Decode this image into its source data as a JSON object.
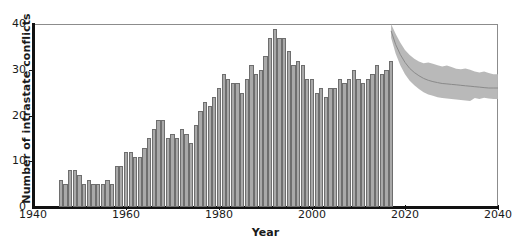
{
  "chart_data": {
    "type": "bar",
    "title": "",
    "xlabel": "Year",
    "ylabel": "Number of intrastate conflicts",
    "xlim": [
      1940,
      2040
    ],
    "ylim": [
      0,
      40
    ],
    "xticks": [
      1940,
      1960,
      1980,
      2000,
      2020,
      2040
    ],
    "yticks": [
      0,
      10,
      20,
      30,
      40
    ],
    "grid": false,
    "legend": null,
    "bar_color": "#a9a9a9",
    "bar_edge_color": "#6e6e6e",
    "band_color": "#b5b5b5",
    "band_line_color": "#8a8a8a",
    "series": [
      {
        "name": "Observed intrastate conflicts",
        "type": "bar",
        "x": [
          1946,
          1947,
          1948,
          1949,
          1950,
          1951,
          1952,
          1953,
          1954,
          1955,
          1956,
          1957,
          1958,
          1959,
          1960,
          1961,
          1962,
          1963,
          1964,
          1965,
          1966,
          1967,
          1968,
          1969,
          1970,
          1971,
          1972,
          1973,
          1974,
          1975,
          1976,
          1977,
          1978,
          1979,
          1980,
          1981,
          1982,
          1983,
          1984,
          1985,
          1986,
          1987,
          1988,
          1989,
          1990,
          1991,
          1992,
          1993,
          1994,
          1995,
          1996,
          1997,
          1998,
          1999,
          2000,
          2001,
          2002,
          2003,
          2004,
          2005,
          2006,
          2007,
          2008,
          2009,
          2010,
          2011,
          2012,
          2013,
          2014,
          2015,
          2016,
          2017
        ],
        "values": [
          6,
          5,
          8,
          8,
          7,
          5,
          6,
          5,
          5,
          5,
          6,
          5,
          9,
          9,
          12,
          12,
          11,
          11,
          13,
          15,
          17,
          19,
          19,
          15,
          16,
          15,
          17,
          16,
          14,
          18,
          21,
          23,
          22,
          24,
          26,
          29,
          28,
          27,
          27,
          25,
          28,
          31,
          29,
          30,
          33,
          37,
          39,
          37,
          37,
          34,
          31,
          32,
          31,
          28,
          28,
          25,
          26,
          24,
          26,
          26,
          28,
          27,
          28,
          30,
          28,
          27,
          28,
          29,
          31,
          29,
          30,
          32
        ]
      },
      {
        "name": "Projection median",
        "type": "line",
        "x": [
          2017,
          2018,
          2019,
          2020,
          2021,
          2022,
          2023,
          2024,
          2025,
          2026,
          2027,
          2028,
          2029,
          2030,
          2031,
          2032,
          2033,
          2034,
          2035,
          2036,
          2037,
          2038,
          2039,
          2040
        ],
        "values": [
          38.5,
          35.5,
          33.3,
          31.6,
          30.3,
          29.4,
          28.7,
          28.1,
          27.7,
          27.4,
          27.2,
          27.0,
          26.9,
          26.8,
          26.7,
          26.6,
          26.5,
          26.4,
          26.3,
          26.2,
          26.1,
          26.0,
          26.0,
          26.0
        ]
      },
      {
        "name": "Projection uncertainty band upper",
        "type": "band-upper",
        "x": [
          2017,
          2018,
          2019,
          2020,
          2021,
          2022,
          2023,
          2024,
          2025,
          2026,
          2027,
          2028,
          2029,
          2030,
          2031,
          2032,
          2033,
          2034,
          2035,
          2036,
          2037,
          2038,
          2039,
          2040
        ],
        "values": [
          40.0,
          37.8,
          35.9,
          34.3,
          33.2,
          32.4,
          31.8,
          31.4,
          31.6,
          31.3,
          31.0,
          30.7,
          30.9,
          30.6,
          30.2,
          30.1,
          30.3,
          30.0,
          29.6,
          29.4,
          29.6,
          29.3,
          29.0,
          29.0
        ]
      },
      {
        "name": "Projection uncertainty band lower",
        "type": "band-lower",
        "x": [
          2017,
          2018,
          2019,
          2020,
          2021,
          2022,
          2023,
          2024,
          2025,
          2026,
          2027,
          2028,
          2029,
          2030,
          2031,
          2032,
          2033,
          2034,
          2035,
          2036,
          2037,
          2038,
          2039,
          2040
        ],
        "values": [
          37.0,
          33.5,
          30.9,
          29.0,
          27.6,
          26.6,
          25.8,
          25.1,
          24.6,
          24.3,
          24.0,
          23.8,
          23.7,
          23.6,
          23.5,
          23.4,
          23.3,
          23.2,
          23.8,
          23.6,
          23.9,
          23.7,
          23.6,
          23.6
        ]
      }
    ]
  }
}
